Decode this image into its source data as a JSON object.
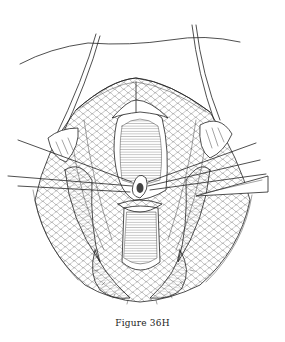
{
  "figure": {
    "caption": "Figure 36H",
    "illustration": {
      "subject": "surgical-line-drawing",
      "colors": {
        "ink": "#222222",
        "paper": "#ffffff"
      }
    }
  }
}
